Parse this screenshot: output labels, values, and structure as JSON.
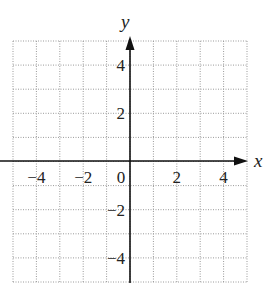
{
  "chart_data": {
    "type": "scatter",
    "title": "",
    "xlabel": "x",
    "ylabel": "y",
    "xlim": [
      -5,
      5
    ],
    "ylim": [
      -5,
      5
    ],
    "grid": true,
    "grid_style": "dotted",
    "grid_step": 1,
    "x_ticks": [
      -4,
      -2,
      0,
      2,
      4
    ],
    "y_ticks": [
      4,
      2,
      -2,
      -4
    ],
    "x_tick_labels": [
      "−4",
      "−2",
      "0",
      "2",
      "4"
    ],
    "y_tick_labels": [
      "4",
      "2",
      "−2",
      "−4"
    ],
    "series": [],
    "legend": null
  },
  "labels": {
    "x_axis": "x",
    "y_axis": "y"
  },
  "colors": {
    "axis": "#111111",
    "grid": "#9a9a9a",
    "text": "#222222"
  }
}
